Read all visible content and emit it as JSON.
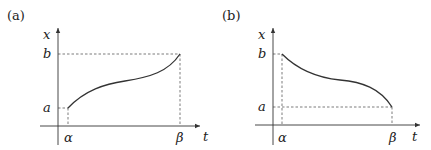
{
  "panels": [
    {
      "label": "(a)",
      "x_axis_label": "t",
      "y_axis_label": "x",
      "y_ticks": [
        "b",
        "a"
      ],
      "x_ticks": [
        "α",
        "β"
      ],
      "description": "increasing curve from (α, a) to (β, b)"
    },
    {
      "label": "(b)",
      "x_axis_label": "t",
      "y_axis_label": "x",
      "y_ticks": [
        "b",
        "a"
      ],
      "x_ticks": [
        "α",
        "β"
      ],
      "description": "decreasing curve from (α, b) to (β, a)"
    }
  ]
}
